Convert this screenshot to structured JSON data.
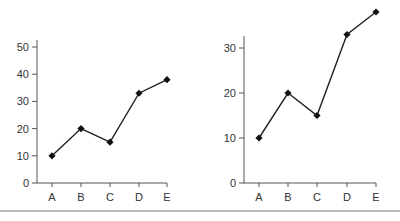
{
  "chart_data": [
    {
      "type": "line",
      "title": "",
      "xlabel": "",
      "ylabel": "",
      "categories": [
        "A",
        "B",
        "C",
        "D",
        "E"
      ],
      "values": [
        10,
        20,
        15,
        33,
        38
      ],
      "ylim": [
        0,
        50
      ],
      "yticks": [
        0,
        10,
        20,
        30,
        40,
        50
      ],
      "grid": false,
      "legend": null,
      "marker": "diamond"
    },
    {
      "type": "line",
      "title": "",
      "xlabel": "",
      "ylabel": "",
      "categories": [
        "A",
        "B",
        "C",
        "D",
        "E"
      ],
      "values": [
        10,
        20,
        15,
        33,
        38
      ],
      "ylim": [
        0,
        38
      ],
      "yticks": [
        0,
        10,
        20,
        30
      ],
      "grid": false,
      "legend": null,
      "marker": "diamond"
    }
  ],
  "colors": {
    "line": "#222222",
    "axis": "#555555",
    "text": "#333333",
    "divider": "#777777"
  }
}
